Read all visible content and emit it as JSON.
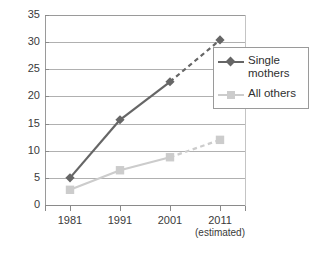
{
  "chart_data": {
    "type": "line",
    "title": "",
    "subtitle": "",
    "xlabel": "",
    "ylabel": "",
    "categories": [
      "1981",
      "1991",
      "2001",
      "2011"
    ],
    "x_tick_sublabels": [
      "",
      "",
      "",
      "(estimated)"
    ],
    "ylim": [
      0,
      35
    ],
    "y_ticks": [
      0,
      5,
      10,
      15,
      20,
      25,
      30,
      35
    ],
    "y_tick_labels": [
      "0",
      "5",
      "10",
      "15",
      "20",
      "25",
      "30",
      "35"
    ],
    "grid": true,
    "legend_position": "upper-right",
    "series": [
      {
        "name": "Single mothers",
        "color": "#666666",
        "marker": "diamond",
        "values": [
          5.0,
          15.7,
          22.7,
          30.4
        ],
        "dashed_from_index": 2
      },
      {
        "name": "All others",
        "color": "#cccccc",
        "marker": "square",
        "values": [
          2.8,
          6.4,
          8.8,
          12.0
        ],
        "dashed_from_index": 2
      }
    ]
  },
  "legend": {
    "items": [
      {
        "label_line1": "Single",
        "label_line2": "mothers"
      },
      {
        "label_line1": "All others",
        "label_line2": ""
      }
    ]
  },
  "colors": {
    "series_single_mothers": "#666666",
    "series_all_others": "#cccccc",
    "gridline": "#b0b0b0",
    "axis": "#8a8a8a",
    "text": "#333333",
    "background": "#ffffff"
  }
}
